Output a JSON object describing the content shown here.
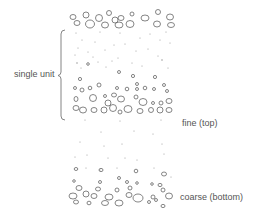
{
  "diagram": {
    "type": "graded-bedding",
    "labels": {
      "bracket": "single unit",
      "fine": "fine (top)",
      "coarse": "coarse (bottom)"
    },
    "colors": {
      "stroke": "#555555",
      "text": "#555555",
      "background": "#ffffff"
    }
  }
}
